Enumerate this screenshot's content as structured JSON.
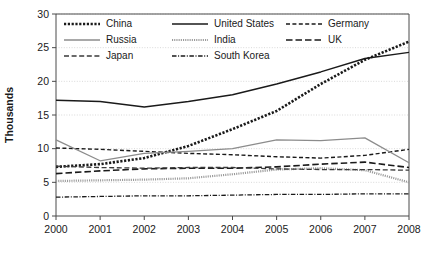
{
  "chart_data": {
    "type": "line",
    "title": "",
    "xlabel": "",
    "ylabel": "Thousands",
    "x": [
      2000,
      2001,
      2002,
      2003,
      2004,
      2005,
      2006,
      2007,
      2008
    ],
    "xtick_labels": [
      "2000",
      "2001",
      "2002",
      "2003",
      "2004",
      "2005",
      "2006",
      "2007",
      "2008"
    ],
    "ytick_labels": [
      "0",
      "5",
      "10",
      "15",
      "20",
      "25",
      "30"
    ],
    "ytick_values": [
      0,
      5,
      10,
      15,
      20,
      25,
      30
    ],
    "xlim": [
      2000,
      2008
    ],
    "ylim": [
      0,
      30
    ],
    "grid": "horizontal-dotted",
    "legend_position": "top-inside",
    "series": [
      {
        "name": "China",
        "values": [
          7.3,
          7.7,
          8.6,
          10.4,
          12.9,
          15.6,
          19.6,
          23.2,
          25.9
        ],
        "color": "#1a1a1a",
        "style": "dotted-thick",
        "dash": "2.2 1.6",
        "width": 2.6
      },
      {
        "name": "United States",
        "values": [
          17.2,
          17.0,
          16.2,
          17.0,
          18.0,
          19.6,
          21.4,
          23.4,
          24.3
        ],
        "color": "#1a1a1a",
        "style": "solid",
        "dash": "none",
        "width": 1.5
      },
      {
        "name": "Germany",
        "values": [
          10.1,
          9.9,
          9.6,
          9.3,
          9.1,
          8.8,
          8.6,
          9.0,
          9.9
        ],
        "color": "#1a1a1a",
        "style": "dashed",
        "dash": "4 2.4",
        "width": 1.4
      },
      {
        "name": "Russia",
        "values": [
          11.3,
          8.2,
          9.3,
          9.6,
          10.0,
          11.3,
          11.2,
          11.6,
          7.9
        ],
        "color": "#8c8c8c",
        "style": "solid",
        "dash": "none",
        "width": 1.3
      },
      {
        "name": "India",
        "values": [
          5.2,
          5.3,
          5.4,
          5.6,
          6.2,
          6.9,
          7.1,
          6.8,
          5.0
        ],
        "color": "#9a9a9a",
        "style": "fine-dotted",
        "dash": "1.1 1.1",
        "width": 2.2
      },
      {
        "name": "UK",
        "values": [
          6.3,
          6.7,
          7.0,
          7.1,
          7.1,
          7.3,
          7.7,
          8.0,
          7.2
        ],
        "color": "#1a1a1a",
        "style": "long-dash",
        "dash": "6.5 3",
        "width": 1.6
      },
      {
        "name": "Japan",
        "values": [
          7.4,
          7.2,
          7.1,
          7.2,
          7.2,
          7.0,
          6.9,
          6.9,
          6.8
        ],
        "color": "#3a3a3a",
        "style": "dash",
        "dash": "5 2.6",
        "width": 1.3
      },
      {
        "name": "South Korea",
        "values": [
          2.8,
          2.9,
          3.0,
          3.0,
          3.1,
          3.2,
          3.2,
          3.3,
          3.3
        ],
        "color": "#1a1a1a",
        "style": "dash-dot",
        "dash": "4.5 1.6 1 1.6",
        "width": 1.3
      }
    ],
    "legend": [
      {
        "label": "China",
        "col": 0,
        "row": 0
      },
      {
        "label": "United States",
        "col": 1,
        "row": 0
      },
      {
        "label": "Germany",
        "col": 2,
        "row": 0
      },
      {
        "label": "Russia",
        "col": 0,
        "row": 1
      },
      {
        "label": "India",
        "col": 1,
        "row": 1
      },
      {
        "label": "UK",
        "col": 2,
        "row": 1
      },
      {
        "label": "Japan",
        "col": 0,
        "row": 2
      },
      {
        "label": "South Korea",
        "col": 1,
        "row": 2
      }
    ]
  }
}
